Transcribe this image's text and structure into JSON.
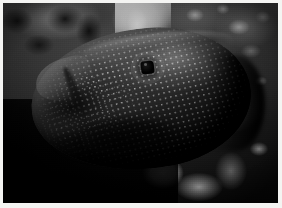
{
  "image": {
    "title": "Spotted reef fish on coral reef",
    "subject": "spotted grouper-like reef fish with dense white spots",
    "medium": "underwater photograph",
    "color_mode": "grayscale",
    "orientation": "landscape",
    "width_px": 282,
    "height_px": 208,
    "border": {
      "style": "thin white photographic print border",
      "color": "#f4f4f2",
      "left_px": 3,
      "top_px": 3,
      "right_px": 4,
      "bottom_px": 5
    }
  },
  "palette": {
    "border_white": "#f4f4f2",
    "highlight_coral": "#d2d2cf",
    "reef_mid_gray": "#6e6e6e",
    "fish_body_gray": "#4b4b49",
    "fish_spot_white": "#fcfcfa",
    "deep_shadow_black": "#0a0a0a",
    "eye_black": "#060606"
  },
  "subject": {
    "label": "spotted reef fish",
    "body": {
      "label": "fish body",
      "description": "oval, laterally compressed body covered in an even grid of small white spots",
      "bounds": {
        "x": 28,
        "y": 26,
        "w": 220,
        "h": 140
      },
      "rotation_deg": -7
    },
    "spots": {
      "label": "white spot pattern",
      "shape": "small square-ish dots",
      "spacing_px": 5.4,
      "dot_size_px": 2,
      "coverage": "dense across flank, fading toward snout and ventral shadow"
    },
    "eye": {
      "label": "eye",
      "description": "dark squarish pupil ringed by pale scales",
      "center": {
        "x": 144,
        "y": 66
      },
      "size_px": 13
    },
    "snout": {
      "label": "snout and jaw",
      "description": "pale highlighted jaw line at the left of the frame",
      "bounds": {
        "x": 32,
        "y": 56,
        "w": 58,
        "h": 40
      }
    },
    "dorsal_edge": {
      "label": "dorsal ridge",
      "description": "rim-lit curved back arcing from lower-left to upper-right"
    },
    "tail_region": {
      "label": "caudal region",
      "description": "body fades into shadow at the right edge of the frame"
    }
  },
  "background": {
    "label": "coral reef background",
    "regions": [
      {
        "name": "upper-left-reef-shadow",
        "label": "dark reef rock, upper left",
        "tone": "dark"
      },
      {
        "name": "top-centre-light-shaft",
        "label": "bright coral highlight, top centre",
        "tone": "bright"
      },
      {
        "name": "upper-right-reef-texture",
        "label": "mottled reef texture, upper right",
        "tone": "mid"
      },
      {
        "name": "lower-left-deep-shadow",
        "label": "deep shadow, lower left",
        "tone": "near-black"
      },
      {
        "name": "lower-right-coral-rubble",
        "label": "bright coral rubble, lower right",
        "tone": "bright"
      },
      {
        "name": "mid-right-murky-water",
        "label": "murky water, mid right",
        "tone": "mid-dark"
      }
    ]
  }
}
